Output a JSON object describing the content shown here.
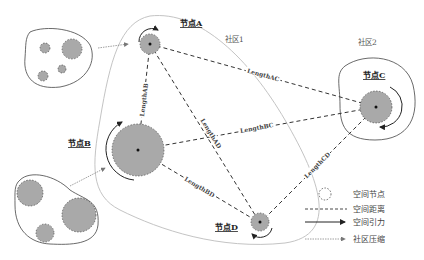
{
  "diagram": {
    "communities": [
      {
        "id": "c1",
        "label": "社区1"
      },
      {
        "id": "c2",
        "label": "社区2"
      }
    ],
    "nodes": [
      {
        "id": "A",
        "label": "节点A"
      },
      {
        "id": "B",
        "label": "节点B"
      },
      {
        "id": "C",
        "label": "节点C"
      },
      {
        "id": "D",
        "label": "节点D"
      }
    ],
    "edges": [
      {
        "from": "A",
        "to": "B",
        "label": "LengthAB"
      },
      {
        "from": "A",
        "to": "C",
        "label": "LengthAC"
      },
      {
        "from": "A",
        "to": "D",
        "label": "LengthAD"
      },
      {
        "from": "B",
        "to": "C",
        "label": "LengthBC"
      },
      {
        "from": "B",
        "to": "D",
        "label": "LengthBD"
      },
      {
        "from": "C",
        "to": "D",
        "label": "LengthCD"
      }
    ],
    "legend": [
      {
        "symbol": "dashed-circle",
        "label": "空间节点"
      },
      {
        "symbol": "dashed-line",
        "label": "空间距离"
      },
      {
        "symbol": "solid-arrow",
        "label": "空间引力"
      },
      {
        "symbol": "dotted-arrow",
        "label": "社区压缩"
      }
    ],
    "colors": {
      "node_fill": "#a9a9a9",
      "stroke": "#333333",
      "community_boundary": "#bdbdbd"
    }
  }
}
